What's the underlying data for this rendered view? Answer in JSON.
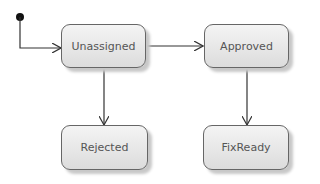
{
  "diagram": {
    "type": "state-machine",
    "initial_state": "Unassigned",
    "states": [
      {
        "id": "unassigned",
        "label": "Unassigned"
      },
      {
        "id": "approved",
        "label": "Approved"
      },
      {
        "id": "rejected",
        "label": "Rejected"
      },
      {
        "id": "fixready",
        "label": "FixReady"
      }
    ],
    "transitions": [
      {
        "from": "initial",
        "to": "Unassigned"
      },
      {
        "from": "Unassigned",
        "to": "Approved"
      },
      {
        "from": "Unassigned",
        "to": "Rejected"
      },
      {
        "from": "Approved",
        "to": "FixReady"
      }
    ]
  }
}
